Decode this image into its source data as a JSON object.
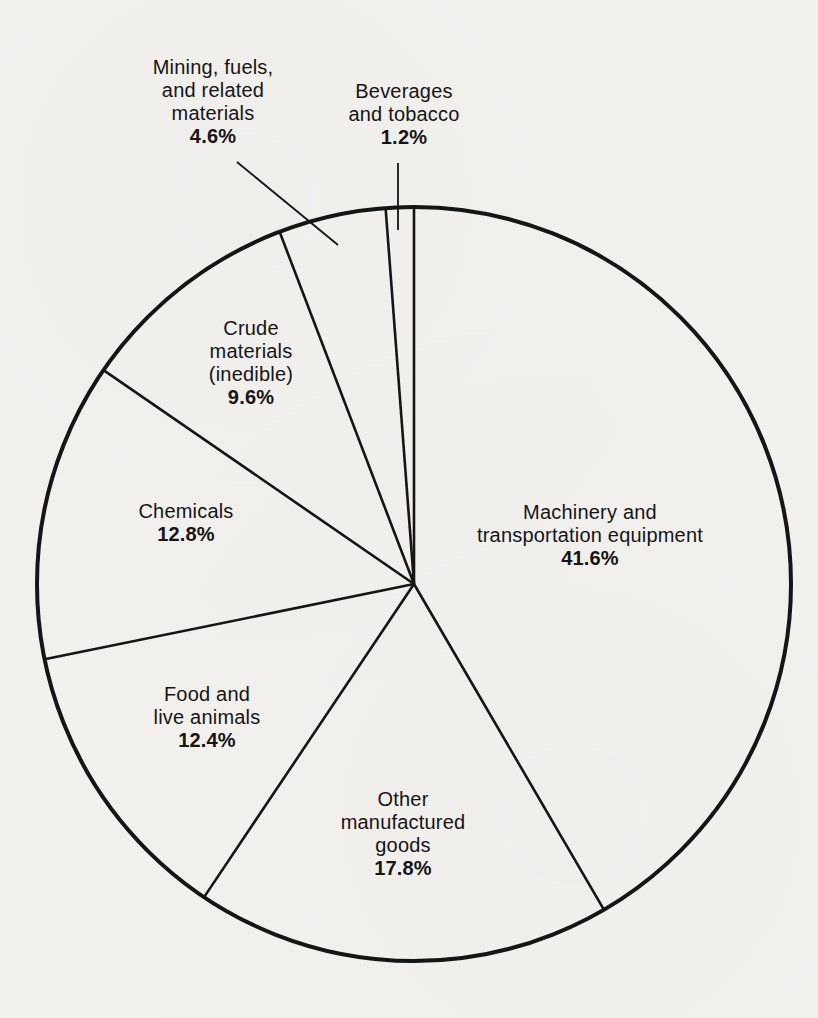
{
  "page": {
    "background_color": "#f2f1ee",
    "ink_color": "#151515"
  },
  "chart_data": {
    "type": "pie",
    "title": "",
    "start_angle_deg": 0,
    "direction": "clockwise",
    "total": 100,
    "style": "outline-only, black stroke on paper background, labels inside slices except two outside labels with leader lines",
    "slices": [
      {
        "label": "Machinery and transportation equipment",
        "value": 41.6,
        "pct_text": "41.6%",
        "name_lines": [
          "Machinery and",
          "transportation equipment"
        ],
        "label_position": "inside-right",
        "leader_line": false
      },
      {
        "label": "Other manufactured goods",
        "value": 17.8,
        "pct_text": "17.8%",
        "name_lines": [
          "Other",
          "manufactured",
          "goods"
        ],
        "label_position": "inside-bottom",
        "leader_line": false
      },
      {
        "label": "Food and live animals",
        "value": 12.4,
        "pct_text": "12.4%",
        "name_lines": [
          "Food and",
          "live animals"
        ],
        "label_position": "inside-lower-left",
        "leader_line": false
      },
      {
        "label": "Chemicals",
        "value": 12.8,
        "pct_text": "12.8%",
        "name_lines": [
          "Chemicals"
        ],
        "label_position": "inside-left",
        "leader_line": false
      },
      {
        "label": "Crude materials (inedible)",
        "value": 9.6,
        "pct_text": "9.6%",
        "name_lines": [
          "Crude",
          "materials",
          "(inedible)"
        ],
        "label_position": "inside-upper-left",
        "leader_line": false
      },
      {
        "label": "Mining, fuels, and related materials",
        "value": 4.6,
        "pct_text": "4.6%",
        "name_lines": [
          "Mining, fuels,",
          "and related",
          "materials"
        ],
        "label_position": "outside-top-left",
        "leader_line": true
      },
      {
        "label": "Beverages and tobacco",
        "value": 1.2,
        "pct_text": "1.2%",
        "name_lines": [
          "Beverages",
          "and tobacco"
        ],
        "label_position": "outside-top",
        "leader_line": true
      }
    ]
  }
}
